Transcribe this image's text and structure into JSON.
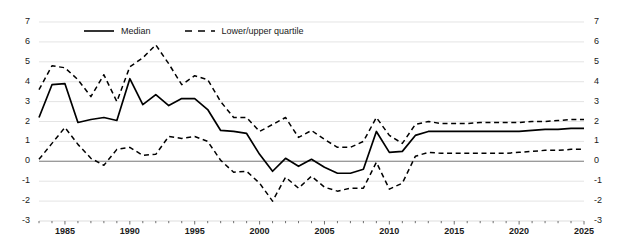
{
  "chart_data": {
    "type": "line",
    "title": "",
    "subtitle": "",
    "xlabel": "",
    "ylabel": "",
    "xlim": [
      1983,
      2025
    ],
    "ylim": [
      -3,
      7
    ],
    "grid": true,
    "grid_axis": "y",
    "legend_position": "top-center",
    "y_ticks": [
      7,
      6,
      5,
      4,
      3,
      2,
      1,
      0,
      -1,
      -2,
      -3
    ],
    "y_ticks_right": [
      7,
      6,
      5,
      4,
      3,
      2,
      1,
      0,
      -1,
      -2,
      -3
    ],
    "x_ticks": [
      1985,
      1990,
      1995,
      2000,
      2005,
      2010,
      2015,
      2020,
      2025
    ],
    "x_minor_tick_interval": 1,
    "zero_line": 0,
    "x": [
      1983,
      1984,
      1985,
      1986,
      1987,
      1988,
      1989,
      1990,
      1991,
      1992,
      1993,
      1994,
      1995,
      1996,
      1997,
      1998,
      1999,
      2000,
      2001,
      2002,
      2003,
      2004,
      2005,
      2006,
      2007,
      2008,
      2009,
      2010,
      2011,
      2012,
      2013,
      2014,
      2015,
      2016,
      2017,
      2018,
      2019,
      2020,
      2021,
      2022,
      2023,
      2024,
      2025
    ],
    "series": [
      {
        "name": "Median",
        "style": "solid",
        "color": "#000000",
        "values": [
          2.2,
          3.85,
          3.9,
          1.95,
          2.1,
          2.2,
          2.05,
          4.15,
          2.85,
          3.35,
          2.8,
          3.15,
          3.15,
          2.6,
          1.55,
          1.5,
          1.4,
          0.35,
          -0.5,
          0.15,
          -0.25,
          0.1,
          -0.3,
          -0.6,
          -0.6,
          -0.4,
          1.5,
          0.45,
          0.5,
          1.3,
          1.5,
          1.5,
          1.5,
          1.5,
          1.5,
          1.5,
          1.5,
          1.5,
          1.55,
          1.6,
          1.6,
          1.65,
          1.65
        ]
      },
      {
        "name": "Lower/upper quartile",
        "style": "dashed",
        "color": "#000000",
        "sub_series": [
          {
            "name": "Upper quartile",
            "values": [
              3.6,
              4.8,
              4.7,
              4.1,
              3.25,
              4.35,
              3.0,
              4.75,
              5.2,
              5.85,
              4.9,
              3.85,
              4.3,
              4.1,
              3.0,
              2.2,
              2.2,
              1.5,
              1.85,
              2.2,
              1.2,
              1.55,
              1.1,
              0.7,
              0.7,
              1.0,
              2.2,
              1.3,
              0.9,
              1.85,
              2.0,
              1.9,
              1.9,
              1.9,
              1.95,
              1.95,
              1.95,
              1.95,
              2.0,
              2.0,
              2.05,
              2.1,
              2.1
            ]
          },
          {
            "name": "Lower quartile",
            "values": [
              0.1,
              0.9,
              1.7,
              0.85,
              0.15,
              -0.2,
              0.6,
              0.7,
              0.3,
              0.35,
              1.25,
              1.15,
              1.25,
              1.0,
              0.05,
              -0.55,
              -0.5,
              -1.1,
              -2.0,
              -0.8,
              -1.35,
              -0.75,
              -1.3,
              -1.5,
              -1.35,
              -1.35,
              -0.05,
              -1.4,
              -1.1,
              0.25,
              0.45,
              0.4,
              0.4,
              0.4,
              0.4,
              0.4,
              0.4,
              0.45,
              0.5,
              0.55,
              0.55,
              0.6,
              0.6
            ]
          }
        ]
      }
    ],
    "legend": [
      {
        "label": "Median",
        "style": "solid"
      },
      {
        "label": "Lower/upper quartile",
        "style": "dashed"
      }
    ]
  }
}
